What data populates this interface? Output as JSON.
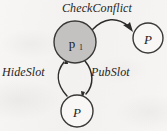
{
  "diagram": {
    "background_color": "#f4f3f1",
    "stroke_color": "#2e2c2b",
    "shaded_node_fill": "#c3c2c0",
    "plain_node_fill": "#f8f7f5",
    "nodes": [
      {
        "id": "p1",
        "label": "p",
        "subscript": "1",
        "style": "shaded",
        "cx": 75,
        "cy": 42,
        "r": 21
      },
      {
        "id": "p-right",
        "label": "P",
        "subscript": "",
        "style": "plain",
        "cx": 148,
        "cy": 38,
        "r": 15
      },
      {
        "id": "p-bottom",
        "label": "P",
        "subscript": "",
        "style": "plain",
        "cx": 77,
        "cy": 111,
        "r": 16
      }
    ],
    "edges": [
      {
        "id": "checkconflict",
        "label": "CheckConflict",
        "from": "p1",
        "to": "p-right",
        "direction": "right"
      },
      {
        "id": "hideslot",
        "label": "HideSlot",
        "from": "p-bottom",
        "to": "p1",
        "direction": "up"
      },
      {
        "id": "pubslot",
        "label": "PubSlot",
        "from": "p1",
        "to": "p-bottom",
        "direction": "down"
      }
    ]
  }
}
